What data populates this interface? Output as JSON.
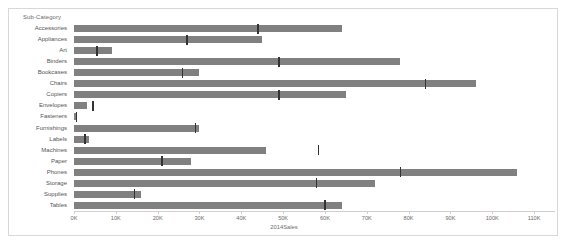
{
  "header": {
    "dimension_label": "Sub-Category"
  },
  "axis": {
    "name": "2014Sales",
    "ticks": [
      "0K",
      "10K",
      "20K",
      "30K",
      "40K",
      "50K",
      "60K",
      "70K",
      "80K",
      "90K",
      "100K",
      "110K"
    ],
    "tick_values": [
      0,
      10000,
      20000,
      30000,
      40000,
      50000,
      60000,
      70000,
      80000,
      90000,
      100000,
      110000
    ]
  },
  "colors": {
    "bar": "#808080",
    "reference_line": "#333333",
    "border": "#d8d8d8",
    "text": "#545454",
    "axis": "#cfcfcf",
    "background": "#ffffff"
  },
  "chart_data": {
    "type": "bar",
    "orientation": "horizontal",
    "title": "",
    "subtitle": "",
    "xlabel": "2014Sales",
    "ylabel": "Sub-Category",
    "xlim": [
      0,
      115000
    ],
    "grid": false,
    "legend": "none",
    "categories": [
      "Accessories",
      "Appliances",
      "Art",
      "Binders",
      "Bookcases",
      "Chairs",
      "Copiers",
      "Envelopes",
      "Fasteners",
      "Furnishings",
      "Labels",
      "Machines",
      "Paper",
      "Phones",
      "Storage",
      "Supplies",
      "Tables"
    ],
    "series": [
      {
        "name": "2014 Sales",
        "values": [
          64000,
          45000,
          9000,
          78000,
          30000,
          96000,
          65000,
          3000,
          700,
          30000,
          3500,
          46000,
          28000,
          106000,
          72000,
          16000,
          64000
        ]
      },
      {
        "name": "Reference marker",
        "type": "reference-line",
        "values": [
          44000,
          27000,
          5500,
          49000,
          26000,
          84000,
          49000,
          4500,
          600,
          29000,
          2600,
          58500,
          21000,
          78000,
          58000,
          14500,
          60000
        ]
      }
    ]
  }
}
